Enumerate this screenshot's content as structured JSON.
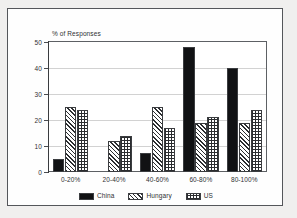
{
  "chart_data": {
    "type": "bar",
    "title": "",
    "subtitle": "",
    "xlabel": "",
    "ylabel": "% of Responses",
    "ylim": [
      0,
      50
    ],
    "yticks": [
      0,
      10,
      20,
      30,
      40,
      50
    ],
    "ytick_labels": [
      "0",
      "10",
      "20",
      "30",
      "40",
      "50"
    ],
    "grid": true,
    "legend_position": "bottom",
    "categories": [
      "0-20%",
      "20-40%",
      "40-60%",
      "60-80%",
      "80-100%"
    ],
    "series": [
      {
        "name": "China",
        "pattern": "solid-black",
        "values": [
          5,
          0,
          7.5,
          48,
          40
        ]
      },
      {
        "name": "Hungary",
        "pattern": "diagonal-hatch",
        "values": [
          25,
          12,
          25,
          19,
          19
        ]
      },
      {
        "name": "US",
        "pattern": "cross-hatch",
        "values": [
          24,
          14,
          17,
          21,
          24
        ]
      }
    ]
  },
  "legend": {
    "items": [
      {
        "label": "China"
      },
      {
        "label": "Hungary"
      },
      {
        "label": "US"
      }
    ]
  },
  "colors": {
    "china": "#111214",
    "outline": "#3b3d40",
    "grid": "#d2d2d2",
    "frame": "#54565a",
    "text": "#2f3133",
    "page_background": "#f0efee"
  }
}
